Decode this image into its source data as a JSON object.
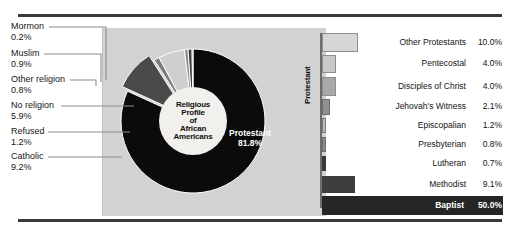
{
  "chart_data": [
    {
      "type": "pie",
      "title": "Religious Profile of African Americans",
      "center_label_lines": [
        "Religious",
        "Profile",
        "of",
        "African",
        "Americans"
      ],
      "categories": [
        "Protestant",
        "Catholic",
        "Refused",
        "No religion",
        "Other religion",
        "Muslim",
        "Mormon"
      ],
      "values": [
        81.8,
        9.2,
        1.2,
        5.9,
        0.8,
        0.9,
        0.2
      ],
      "units": "%",
      "legend": "callout-labels",
      "slices": [
        {
          "label": "Protestant",
          "value": "81.8%",
          "num": 81.8,
          "color": "#0b0b0b",
          "text_color": "#ffffff",
          "inside_label": true
        },
        {
          "label": "Catholic",
          "value": "9.2%",
          "num": 9.2,
          "color": "#4a4a4a",
          "exploded": true
        },
        {
          "label": "Refused",
          "value": "1.2%",
          "num": 1.2,
          "color": "#7d7d7d"
        },
        {
          "label": "No religion",
          "value": "5.9%",
          "num": 5.9,
          "color": "#cfcfcf"
        },
        {
          "label": "Other religion",
          "value": "0.8%",
          "num": 0.8,
          "color": "#8a8a8a"
        },
        {
          "label": "Muslim",
          "value": "0.9%",
          "num": 0.9,
          "color": "#3d3d3d"
        },
        {
          "label": "Mormon",
          "value": "0.2%",
          "num": 0.2,
          "color": "#6a6a6a"
        }
      ],
      "callouts": [
        {
          "name": "Mormon",
          "value": "0.2%"
        },
        {
          "name": "Muslim",
          "value": "0.9%"
        },
        {
          "name": "Other religion",
          "value": "0.8%"
        },
        {
          "name": "No religion",
          "value": "5.9%"
        },
        {
          "name": "Refused",
          "value": "1.2%"
        },
        {
          "name": "Catholic",
          "value": "9.2%"
        }
      ]
    },
    {
      "type": "bar",
      "orientation": "horizontal",
      "axis_label": "Protestant",
      "title": "",
      "xlabel": "",
      "ylabel": "Protestant",
      "categories": [
        "Other Protestants",
        "Pentecostal",
        "Disciples of Christ",
        "Jehovah's Witness",
        "Episcopalian",
        "Presbyterian",
        "Lutheran",
        "Methodist",
        "Baptist"
      ],
      "values": [
        10.0,
        4.0,
        4.0,
        2.1,
        1.2,
        0.8,
        0.7,
        9.1,
        50.0
      ],
      "units": "%",
      "xlim": [
        0,
        50
      ],
      "grid": false,
      "bars": [
        {
          "label": "Other Protestants",
          "value": "10.0%",
          "num": 10.0,
          "color": "#d6d6d6",
          "border": "#8e8e8e",
          "highlight": false
        },
        {
          "label": "Pentecostal",
          "value": "4.0%",
          "num": 4.0,
          "color": "#c9c9c9",
          "border": "#8e8e8e",
          "highlight": false
        },
        {
          "label": "Disciples of Christ",
          "value": "4.0%",
          "num": 4.0,
          "color": "#a9a9a9",
          "border": "#8e8e8e",
          "highlight": false
        },
        {
          "label": "Jehovah's Witness",
          "value": "2.1%",
          "num": 2.1,
          "color": "#909090",
          "border": "#6e6e6e",
          "highlight": false
        },
        {
          "label": "Episcopalian",
          "value": "1.2%",
          "num": 1.2,
          "color": "#bdbdbd",
          "border": "#7a7a7a",
          "highlight": false
        },
        {
          "label": "Presbyterian",
          "value": "0.8%",
          "num": 0.8,
          "color": "#8a8a8a",
          "border": "#6e6e6e",
          "highlight": false
        },
        {
          "label": "Lutheran",
          "value": "0.7%",
          "num": 0.7,
          "color": "#3a3a3a",
          "border": "#3a3a3a",
          "highlight": false
        },
        {
          "label": "Methodist",
          "value": "9.1%",
          "num": 9.1,
          "color": "#3d3d3d",
          "border": "#3d3d3d",
          "highlight": false
        },
        {
          "label": "Baptist",
          "value": "50.0%",
          "num": 50.0,
          "color": "#262626",
          "border": "#262626",
          "highlight": true
        }
      ]
    }
  ]
}
